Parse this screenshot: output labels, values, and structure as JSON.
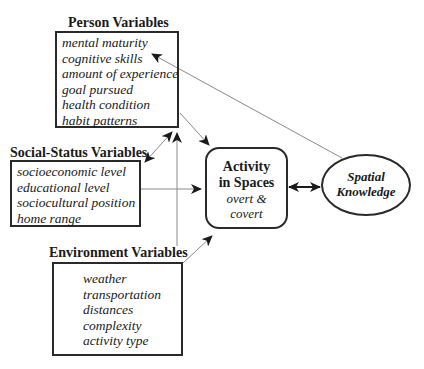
{
  "person": {
    "title": "Person Variables",
    "items": [
      "mental maturity",
      "cognitive skills",
      "amount of experience",
      "goal pursued",
      "health condition",
      "habit patterns"
    ]
  },
  "social": {
    "title": "Social-Status Variables",
    "items": [
      "socioeconomic level",
      "educational level",
      "sociocultural position",
      "home range"
    ]
  },
  "environment": {
    "title": "Environment Variables",
    "items": [
      "weather",
      "transportation",
      "distances",
      "complexity",
      "activity type"
    ]
  },
  "activity": {
    "title_line1": "Activity",
    "title_line2": "in Spaces",
    "sub_line1": "overt &",
    "sub_line2": "covert"
  },
  "spatial": {
    "line1": "Spatial",
    "line2": "Knowledge"
  },
  "colors": {
    "stroke": "#2a2a2a",
    "thin_line": "#8a8a8a",
    "background": "#ffffff"
  }
}
